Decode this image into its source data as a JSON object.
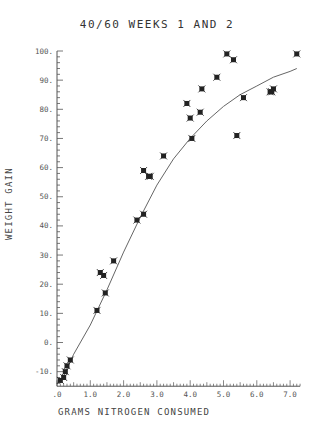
{
  "chart_data": {
    "type": "scatter",
    "title": "40/60  WEEKS 1 AND 2",
    "xlabel": "GRAMS NITROGEN CONSUMED",
    "ylabel": "WEIGHT GAIN",
    "xlim": [
      0,
      7.3
    ],
    "ylim": [
      -15,
      100
    ],
    "x_ticks": [
      ".0",
      "1.0",
      "2.0",
      "3.0",
      "4.0",
      "5.0",
      "6.0",
      "7.0"
    ],
    "y_ticks": [
      "-10.",
      "0.",
      "10.",
      "20.",
      "30.",
      "40.",
      "50.",
      "60.",
      "70.",
      "80.",
      "90.",
      "100."
    ],
    "grid": false,
    "legend": null,
    "series": [
      {
        "name": "observations",
        "marker": "asterisk",
        "points": [
          [
            0.1,
            -13
          ],
          [
            0.2,
            -12
          ],
          [
            0.25,
            -10
          ],
          [
            0.3,
            -8
          ],
          [
            0.4,
            -6
          ],
          [
            1.2,
            11
          ],
          [
            1.3,
            24
          ],
          [
            1.4,
            23
          ],
          [
            1.45,
            17
          ],
          [
            1.7,
            28
          ],
          [
            2.4,
            42
          ],
          [
            2.6,
            44
          ],
          [
            2.6,
            59
          ],
          [
            2.75,
            57
          ],
          [
            2.8,
            57
          ],
          [
            3.2,
            64
          ],
          [
            3.9,
            82
          ],
          [
            4.0,
            77
          ],
          [
            4.05,
            70
          ],
          [
            4.3,
            79
          ],
          [
            4.35,
            87
          ],
          [
            4.8,
            91
          ],
          [
            5.1,
            99
          ],
          [
            5.3,
            97
          ],
          [
            5.4,
            71
          ],
          [
            5.6,
            84
          ],
          [
            6.4,
            86
          ],
          [
            6.45,
            86
          ],
          [
            6.5,
            87
          ],
          [
            7.2,
            99
          ]
        ]
      },
      {
        "name": "fitted curve",
        "type": "line",
        "points": [
          [
            0.1,
            -14
          ],
          [
            0.5,
            -4
          ],
          [
            1.0,
            6
          ],
          [
            1.5,
            18
          ],
          [
            2.0,
            31
          ],
          [
            2.5,
            43
          ],
          [
            3.0,
            54
          ],
          [
            3.5,
            63
          ],
          [
            4.0,
            70
          ],
          [
            4.5,
            76
          ],
          [
            5.0,
            81
          ],
          [
            5.5,
            85
          ],
          [
            6.0,
            88
          ],
          [
            6.5,
            91
          ],
          [
            7.0,
            93
          ],
          [
            7.2,
            94
          ]
        ]
      }
    ]
  }
}
